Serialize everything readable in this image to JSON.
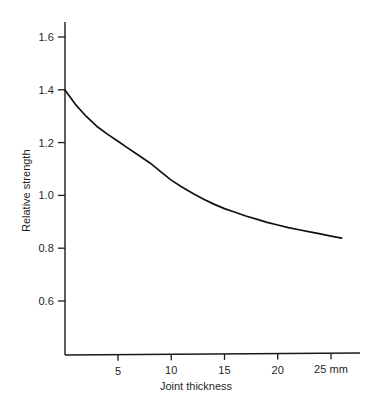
{
  "chart_data": {
    "type": "line",
    "title": "",
    "subtitle": "",
    "xlabel": "Joint thickness",
    "ylabel": "Relative strength",
    "x_unit_label": "mm",
    "xlim": [
      0,
      27.7
    ],
    "ylim": [
      0.42,
      1.72
    ],
    "grid": false,
    "legend": null,
    "x_ticks": [
      {
        "value": 5,
        "label": "5"
      },
      {
        "value": 10,
        "label": "10"
      },
      {
        "value": 15,
        "label": "15"
      },
      {
        "value": 20,
        "label": "20"
      },
      {
        "value": 25,
        "label": "25 mm"
      }
    ],
    "y_ticks": [
      {
        "value": 1.6,
        "label": "1.6"
      },
      {
        "value": 1.4,
        "label": "1.4"
      },
      {
        "value": 1.2,
        "label": "1.2"
      },
      {
        "value": 1.0,
        "label": "1.0"
      },
      {
        "value": 0.8,
        "label": "0.8"
      },
      {
        "value": 0.6,
        "label": "0.6"
      }
    ],
    "series": [
      {
        "name": "Relative strength vs joint thickness",
        "color": "#111111",
        "x": [
          0,
          1,
          2,
          3,
          4,
          5,
          6,
          7,
          8,
          9,
          10,
          11,
          12,
          13,
          14,
          15,
          16,
          17,
          18,
          19,
          20,
          21,
          22,
          23,
          24,
          25,
          26
        ],
        "values": [
          1.4,
          1.345,
          1.3,
          1.262,
          1.232,
          1.205,
          1.177,
          1.15,
          1.123,
          1.09,
          1.058,
          1.032,
          1.008,
          0.986,
          0.967,
          0.95,
          0.936,
          0.922,
          0.91,
          0.898,
          0.888,
          0.878,
          0.87,
          0.862,
          0.854,
          0.846,
          0.838
        ]
      }
    ]
  },
  "axes_geometry": {
    "plot_left": 65,
    "plot_right": 358,
    "plot_top": 22,
    "plot_bottom": 355,
    "value_to_pixel_note": "x: 5mm=118px, 25mm=331px; y: 1.6=37px, 0.6=301px"
  }
}
